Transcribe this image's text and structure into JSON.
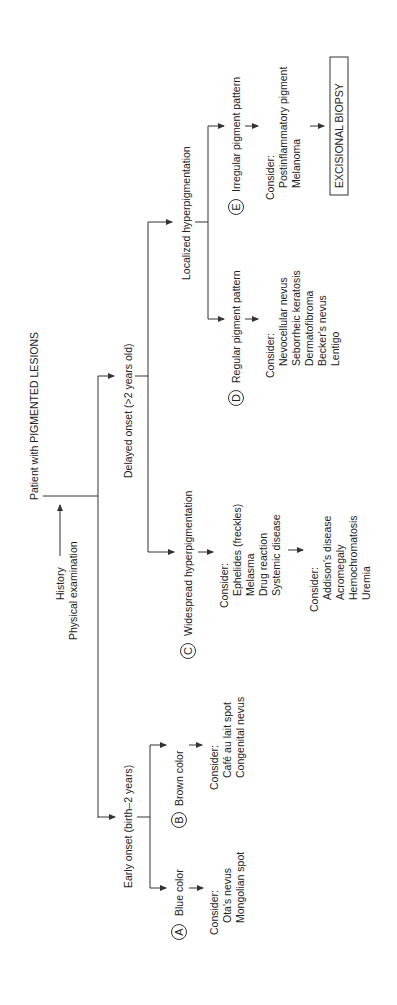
{
  "root": {
    "label": "Patient with PIGMENTED LESIONS",
    "step": [
      "History",
      "Physical examination"
    ]
  },
  "delayed": {
    "label": "Delayed onset (>2 years old)",
    "localized": {
      "label": "Localized hyperpigmentation",
      "regular": {
        "marker": "D",
        "label": "Regular pigment pattern",
        "consider": "Consider:",
        "items": [
          "Nevocellular nevus",
          "Seborrheic keratosis",
          "Dermatofibroma",
          "Becker's nevus",
          "Lentigo"
        ]
      },
      "irregular": {
        "marker": "E",
        "label": "Irregular pigment pattern",
        "consider": "Consider:",
        "items": [
          "Postinflammatory pigment",
          "Melanoma"
        ],
        "action": "EXCISIONAL BIOPSY"
      }
    },
    "widespread": {
      "marker": "C",
      "label": "Widespread hyperpigmentation",
      "consider": "Consider:",
      "items": [
        "Ephelides (freckles)",
        "Melasma",
        "Drug reaction",
        "Systemic disease"
      ],
      "consider2": "Consider:",
      "items2": [
        "Addison's disease",
        "Acromegaly",
        "Hemochromatosis",
        "Uremia"
      ]
    }
  },
  "early": {
    "label": "Early onset (birth–2 years)",
    "brown": {
      "marker": "B",
      "label": "Brown color",
      "consider": "Consider:",
      "items": [
        "Café au lait spot",
        "Congenital nevus"
      ]
    },
    "blue": {
      "marker": "A",
      "label": "Blue color",
      "consider": "Consider:",
      "items": [
        "Ota's nevus",
        "Mongolian spot"
      ]
    }
  }
}
